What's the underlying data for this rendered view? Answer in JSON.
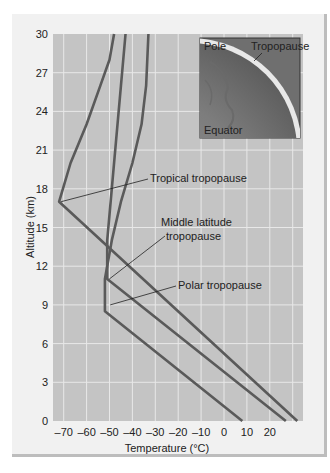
{
  "chart_data": {
    "type": "line",
    "title": "",
    "xlabel": "Temperature (°C)",
    "ylabel": "Altitude (km)",
    "xlim": [
      -75,
      33
    ],
    "ylim": [
      0,
      30
    ],
    "xticks": [
      -70,
      -60,
      -50,
      -40,
      -30,
      -20,
      -10,
      0,
      10,
      20
    ],
    "xtick_labels": [
      "–70",
      "–60",
      "–50",
      "–40",
      "–30",
      "–20",
      "–10",
      "0",
      "10",
      "20"
    ],
    "yticks": [
      0,
      3,
      6,
      9,
      12,
      15,
      18,
      21,
      24,
      27,
      30
    ],
    "ytick_labels": [
      "0",
      "3",
      "6",
      "9",
      "12",
      "15",
      "18",
      "21",
      "24",
      "27",
      "30"
    ],
    "grid": true,
    "series": [
      {
        "name": "Tropical",
        "points": [
          [
            32,
            0
          ],
          [
            -72,
            17
          ],
          [
            -67,
            20
          ],
          [
            -60,
            23
          ],
          [
            -54,
            26
          ],
          [
            -50,
            28
          ],
          [
            -48,
            30
          ]
        ]
      },
      {
        "name": "Middle latitude",
        "points": [
          [
            27,
            0
          ],
          [
            -51,
            11
          ],
          [
            -51,
            14
          ],
          [
            -49,
            18
          ],
          [
            -47,
            22
          ],
          [
            -45,
            26
          ],
          [
            -43,
            30
          ]
        ]
      },
      {
        "name": "Polar",
        "points": [
          [
            8,
            0
          ],
          [
            -52,
            8.5
          ],
          [
            -52,
            11
          ],
          [
            -49,
            14
          ],
          [
            -45,
            17
          ],
          [
            -40,
            20
          ],
          [
            -36,
            23
          ],
          [
            -34,
            26
          ],
          [
            -33,
            30
          ]
        ]
      }
    ],
    "annotations": [
      {
        "text": "Tropical tropopause",
        "target": [
          -72,
          17
        ]
      },
      {
        "text": "Middle latitude tropopause",
        "target": [
          -51,
          11
        ]
      },
      {
        "text": "Polar tropopause",
        "target": [
          -51,
          9
        ]
      }
    ],
    "inset": {
      "labels": [
        "Pole",
        "Tropopause",
        "Equator"
      ]
    }
  },
  "labels": {
    "ylabel": "Altitude (km)",
    "xlabel": "Temperature (°C)",
    "ann_tropical": "Tropical tropopause",
    "ann_mid_1": "Middle latitude",
    "ann_mid_2": "tropopause",
    "ann_polar": "Polar tropopause",
    "inset_pole": "Pole",
    "inset_tropopause": "Tropopause",
    "inset_equator": "Equator"
  },
  "colors": {
    "plot_bg": "#c4c4c4",
    "grid": "#e8e8e8",
    "line": "#5a5a5a",
    "frame_bg": "#f1f1f1"
  }
}
